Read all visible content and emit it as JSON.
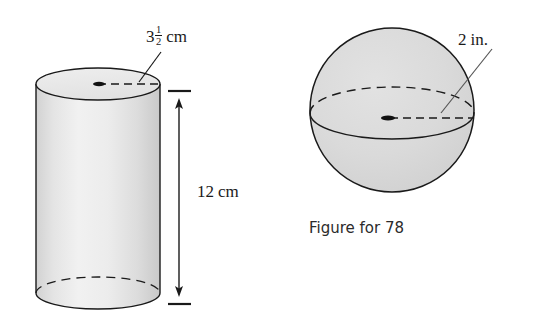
{
  "figure": {
    "background_color": "#ffffff",
    "stroke_color": "#1a1a1a",
    "solid_fill": "#d9d9d9",
    "caption": "Figure for 78",
    "cylinder": {
      "name": "cylinder",
      "diameter_label": {
        "whole": "3",
        "numerator": "1",
        "denominator": "2",
        "unit": "cm",
        "full_text": "3 1/2 cm"
      },
      "height_label": {
        "value": "12",
        "unit": "cm",
        "full_text": "12 cm"
      }
    },
    "sphere": {
      "name": "sphere",
      "diameter_label": {
        "value": "2",
        "unit": "in.",
        "full_text": "2 in."
      }
    }
  }
}
